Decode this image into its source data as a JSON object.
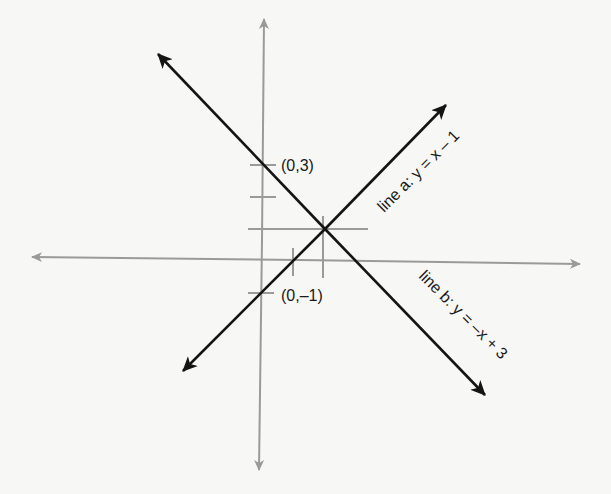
{
  "diagram": {
    "type": "coordinate-plane",
    "colors": {
      "background": "#f7f7f5",
      "axis": "#9a9a9a",
      "guide": "#9a9a9a",
      "line": "#141414",
      "text": "#1a1a1a"
    },
    "labels": {
      "point_y_intercept_b": "(0,3)",
      "point_y_intercept_a": "(0,–1)",
      "line_a": "line a: y = x – 1",
      "line_b": "line b: y = –x + 3"
    },
    "lines": [
      {
        "name": "line a",
        "equation": "y = x - 1",
        "slope": 1,
        "intercept": -1
      },
      {
        "name": "line b",
        "equation": "y = -x + 3",
        "slope": -1,
        "intercept": 3
      }
    ],
    "intersection": {
      "x": 2,
      "y": 1
    },
    "y_ticks": [
      3,
      2,
      -1
    ],
    "x_ticks": [
      1,
      2
    ]
  }
}
